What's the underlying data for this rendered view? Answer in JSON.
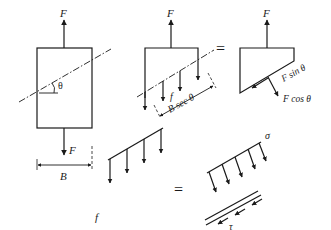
{
  "figure": {
    "stroke_color": "#1a1a1a",
    "background": "#ffffff"
  },
  "panels": {
    "whole_bar": {
      "force_top": "F",
      "force_bottom": "F",
      "angle": "θ",
      "width_dim": "B"
    },
    "cut_section": {
      "force_top": "F",
      "distributed_load": "f",
      "inclined_length": "B sec θ"
    },
    "equals_1": "=",
    "resolved_forces": {
      "force_top": "F",
      "shear_component": "F sin θ",
      "normal_component": "F cos θ"
    },
    "distributed_plane": {
      "load": "f"
    },
    "equals_2": "=",
    "stress_components": {
      "normal_stress": "σ",
      "shear_stress": "τ"
    }
  }
}
